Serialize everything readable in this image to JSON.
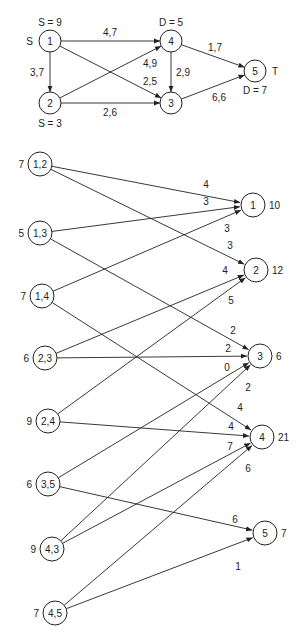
{
  "network": {
    "nodes": [
      {
        "id": "1",
        "label": "1",
        "x": 50,
        "y": 41,
        "r": 11,
        "annotations": [
          {
            "text": "S = 9",
            "x": 50,
            "y": 22,
            "anchor": "middle"
          },
          {
            "text": "S",
            "x": 33,
            "y": 41,
            "anchor": "end"
          }
        ]
      },
      {
        "id": "2",
        "label": "2",
        "x": 50,
        "y": 103,
        "r": 11,
        "annotations": [
          {
            "text": "S = 3",
            "x": 50,
            "y": 123,
            "anchor": "middle"
          }
        ]
      },
      {
        "id": "3",
        "label": "3",
        "x": 171,
        "y": 103,
        "r": 11,
        "annotations": []
      },
      {
        "id": "4",
        "label": "4",
        "x": 171,
        "y": 41,
        "r": 11,
        "annotations": [
          {
            "text": "D = 5",
            "x": 171,
            "y": 22,
            "anchor": "middle"
          }
        ]
      },
      {
        "id": "5",
        "label": "5",
        "x": 255,
        "y": 71,
        "r": 11,
        "annotations": [
          {
            "text": "T",
            "x": 272,
            "y": 71,
            "anchor": "start"
          },
          {
            "text": "D = 7",
            "x": 255,
            "y": 90,
            "anchor": "middle"
          }
        ]
      }
    ],
    "edges": [
      {
        "from": "1",
        "to": "4",
        "label": "4,7",
        "lx": 110,
        "ly": 32
      },
      {
        "from": "1",
        "to": "2",
        "label": "3,7",
        "lx": 37,
        "ly": 72
      },
      {
        "from": "1",
        "to": "3",
        "label": "2,5",
        "lx": 150,
        "ly": 81
      },
      {
        "from": "2",
        "to": "4",
        "label": "4,9",
        "lx": 150,
        "ly": 63
      },
      {
        "from": "2",
        "to": "3",
        "label": "2,6",
        "lx": 110,
        "ly": 112
      },
      {
        "from": "4",
        "to": "3",
        "label": "2,9",
        "lx": 183,
        "ly": 72
      },
      {
        "from": "4",
        "to": "5",
        "label": "1,7",
        "lx": 215,
        "ly": 47
      },
      {
        "from": "3",
        "to": "5",
        "label": "6,6",
        "lx": 219,
        "ly": 97
      }
    ]
  },
  "bipartite": {
    "sources": [
      {
        "id": "1,2",
        "label": "1,2",
        "x": 40,
        "y": 164,
        "supply": "7"
      },
      {
        "id": "1,3",
        "label": "1,3",
        "x": 40,
        "y": 233,
        "supply": "5"
      },
      {
        "id": "1,4",
        "label": "1,4",
        "x": 42,
        "y": 296,
        "supply": "7"
      },
      {
        "id": "2,3",
        "label": "2,3",
        "x": 45,
        "y": 358,
        "supply": "6"
      },
      {
        "id": "2,4",
        "label": "2,4",
        "x": 48,
        "y": 421,
        "supply": "9"
      },
      {
        "id": "3,5",
        "label": "3,5",
        "x": 48,
        "y": 484,
        "supply": "6"
      },
      {
        "id": "4,3",
        "label": "4,3",
        "x": 52,
        "y": 549,
        "supply": "9"
      },
      {
        "id": "4,5",
        "label": "4,5",
        "x": 55,
        "y": 613,
        "supply": "7"
      }
    ],
    "sinks": [
      {
        "id": "1",
        "label": "1",
        "x": 253,
        "y": 205,
        "demand": "10"
      },
      {
        "id": "2",
        "label": "2",
        "x": 256,
        "y": 270,
        "demand": "12"
      },
      {
        "id": "3",
        "label": "3",
        "x": 260,
        "y": 356,
        "demand": "6"
      },
      {
        "id": "4",
        "label": "4",
        "x": 262,
        "y": 437,
        "demand": "21"
      },
      {
        "id": "5",
        "label": "5",
        "x": 265,
        "y": 533,
        "demand": "7"
      }
    ],
    "radius": 12,
    "edges": [
      {
        "from": "1,2",
        "to": "1",
        "cost": "4",
        "lx": 206,
        "ly": 184
      },
      {
        "from": "1,2",
        "to": "2",
        "cost": "3",
        "lx": 230,
        "ly": 245
      },
      {
        "from": "1,3",
        "to": "1",
        "cost": "3",
        "lx": 206,
        "ly": 201
      },
      {
        "from": "1,3",
        "to": "3",
        "cost": "2",
        "lx": 233,
        "ly": 330
      },
      {
        "from": "1,4",
        "to": "1",
        "cost": "3",
        "lx": 227,
        "ly": 228
      },
      {
        "from": "1,4",
        "to": "4",
        "cost": "4",
        "lx": 240,
        "ly": 407
      },
      {
        "from": "2,3",
        "to": "2",
        "cost": "4",
        "lx": 225,
        "ly": 270
      },
      {
        "from": "2,3",
        "to": "3",
        "cost": "2",
        "lx": 228,
        "ly": 348
      },
      {
        "from": "2,4",
        "to": "2",
        "cost": "5",
        "lx": 231,
        "ly": 300
      },
      {
        "from": "2,4",
        "to": "4",
        "cost": "4",
        "lx": 231,
        "ly": 426
      },
      {
        "from": "3,5",
        "to": "3",
        "cost": "0",
        "lx": 227,
        "ly": 367
      },
      {
        "from": "3,5",
        "to": "5",
        "cost": "6",
        "lx": 235,
        "ly": 519
      },
      {
        "from": "4,3",
        "to": "3",
        "cost": "2",
        "lx": 248,
        "ly": 387
      },
      {
        "from": "4,3",
        "to": "4",
        "cost": "7",
        "lx": 230,
        "ly": 446
      },
      {
        "from": "4,5",
        "to": "4",
        "cost": "6",
        "lx": 248,
        "ly": 468
      },
      {
        "from": "4,5",
        "to": "5",
        "cost": "1",
        "lx": 238,
        "ly": 566
      }
    ]
  }
}
